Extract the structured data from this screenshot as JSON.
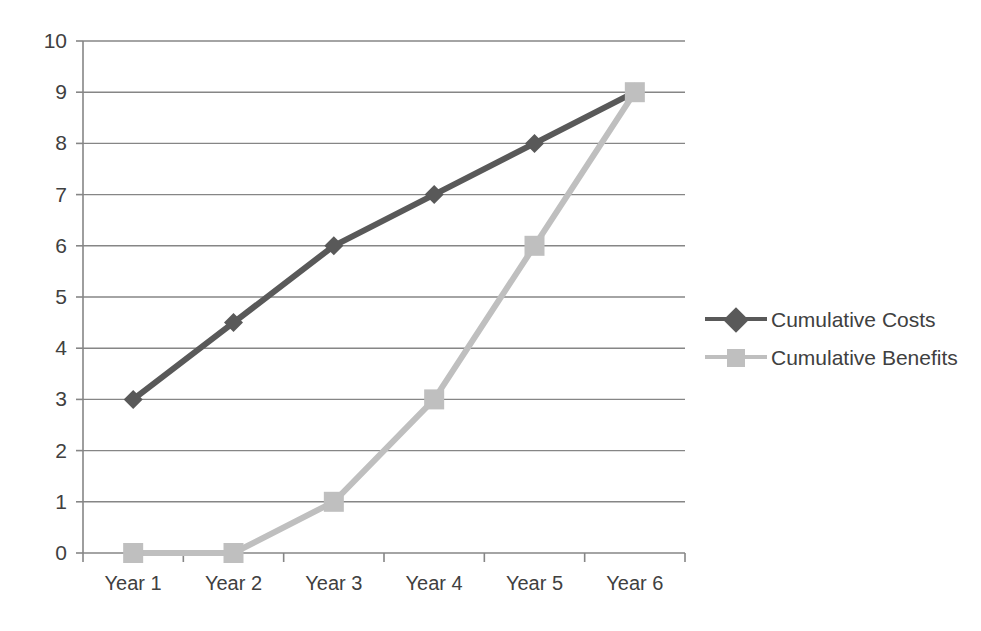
{
  "chart_data": {
    "type": "line",
    "title": "",
    "subtitle": "",
    "xlabel": "",
    "ylabel": "",
    "categories": [
      "Year 1",
      "Year 2",
      "Year 3",
      "Year 4",
      "Year 5",
      "Year 6"
    ],
    "series": [
      {
        "name": "Cumulative Costs",
        "values": [
          3,
          4.5,
          6,
          7,
          8,
          9
        ],
        "color": "#595959",
        "marker": "diamond"
      },
      {
        "name": "Cumulative Benefits",
        "values": [
          0,
          0,
          1,
          3,
          6,
          9
        ],
        "color": "#bfbfbf",
        "marker": "square"
      }
    ],
    "ylim": [
      0,
      10
    ],
    "ytick_labels": [
      "0",
      "1",
      "2",
      "3",
      "4",
      "5",
      "6",
      "7",
      "8",
      "9",
      "10"
    ],
    "ytick_values": [
      0,
      1,
      2,
      3,
      4,
      5,
      6,
      7,
      8,
      9,
      10
    ],
    "grid": "horizontal",
    "grid_color": "#868686",
    "axis_color": "#868686",
    "legend_position": "right",
    "legend": [
      {
        "label": "Cumulative Costs",
        "color": "#595959",
        "marker": "diamond"
      },
      {
        "label": "Cumulative Benefits",
        "color": "#bfbfbf",
        "marker": "square"
      }
    ]
  }
}
